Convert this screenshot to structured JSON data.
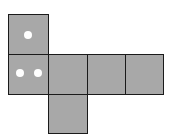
{
  "diagram": {
    "type": "cube-net",
    "face_color": "#a8a8a8",
    "border_color": "#1a1a1a",
    "dot_color": "#ffffff",
    "faces": [
      {
        "id": "top",
        "dots": 1
      },
      {
        "id": "row-1",
        "dots": 2
      },
      {
        "id": "row-2",
        "dots": 0
      },
      {
        "id": "row-3",
        "dots": 0
      },
      {
        "id": "row-4",
        "dots": 0
      },
      {
        "id": "bottom",
        "dots": 0
      }
    ]
  }
}
